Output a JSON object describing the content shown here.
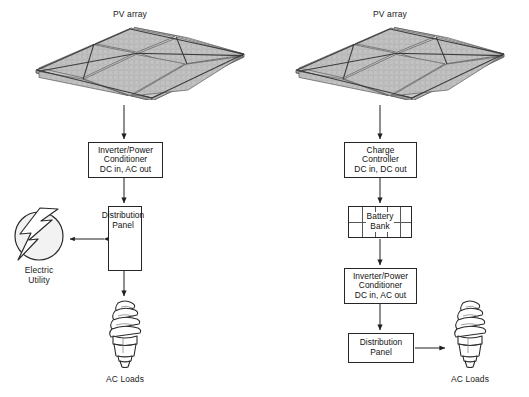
{
  "diagram": {
    "background_color": "#ffffff",
    "line_color": "#262626",
    "panel_fill": "#c9c9c9"
  },
  "systems": [
    {
      "id": "grid-tied",
      "nodes": {
        "pv_array_label": "PV array",
        "inverter": "Inverter/Power\nConditioner\nDC in, AC out",
        "distribution_panel": "Distribution\nPanel",
        "electric_utility": "Electric\nUtility",
        "ac_loads": "AC Loads"
      },
      "icons": {
        "pv_array": "solar-panel-array-icon",
        "utility": "lightning-bolt-circle-icon",
        "load": "compact-fluorescent-bulb-icon"
      },
      "connections": [
        {
          "from": "pv_array",
          "to": "inverter",
          "type": "arrow-down"
        },
        {
          "from": "inverter",
          "to": "distribution_panel",
          "type": "arrow-down"
        },
        {
          "from": "distribution_panel",
          "to": "electric_utility",
          "type": "arrow-bidirectional"
        },
        {
          "from": "distribution_panel",
          "to": "ac_loads",
          "type": "arrow-down"
        }
      ]
    },
    {
      "id": "standalone",
      "nodes": {
        "pv_array_label": "PV array",
        "charge_controller": "Charge\nController\nDC in, DC out",
        "battery_bank": "Battery\nBank",
        "inverter": "Inverter/Power\nConditioner\nDC in, AC out",
        "distribution_panel": "Distribution\nPanel",
        "ac_loads": "AC Loads"
      },
      "icons": {
        "pv_array": "solar-panel-array-icon",
        "load": "compact-fluorescent-bulb-icon"
      },
      "connections": [
        {
          "from": "pv_array",
          "to": "charge_controller",
          "type": "arrow-down"
        },
        {
          "from": "charge_controller",
          "to": "battery_bank",
          "type": "arrow-down"
        },
        {
          "from": "battery_bank",
          "to": "inverter",
          "type": "arrow-down"
        },
        {
          "from": "inverter",
          "to": "distribution_panel",
          "type": "arrow-down"
        },
        {
          "from": "distribution_panel",
          "to": "ac_loads",
          "type": "arrow-right"
        }
      ]
    }
  ]
}
